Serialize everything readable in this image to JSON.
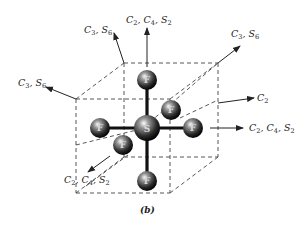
{
  "figure": {
    "caption": "(b)",
    "molecule": "SF6",
    "central_atom": {
      "label": "S"
    },
    "ligand_atoms": [
      {
        "position": "top",
        "label": "F"
      },
      {
        "position": "bottom",
        "label": "F"
      },
      {
        "position": "left",
        "label": "F"
      },
      {
        "position": "right",
        "label": "F"
      },
      {
        "position": "back",
        "label": "F"
      },
      {
        "position": "front",
        "label": "F"
      }
    ],
    "axis_labels": {
      "top": {
        "parts": [
          "C",
          "2",
          ", C",
          "4",
          ", S",
          "2"
        ]
      },
      "upper_left": {
        "parts": [
          "C",
          "3",
          ", S",
          "6"
        ]
      },
      "left": {
        "parts": [
          "C",
          "3",
          ", S",
          "6"
        ]
      },
      "upper_right": {
        "parts": [
          "C",
          "3",
          ", S",
          "6"
        ]
      },
      "right_c2": {
        "parts": [
          "C",
          "2"
        ]
      },
      "right": {
        "parts": [
          "C",
          "2",
          ", C",
          "4",
          ", S",
          "2"
        ]
      },
      "lower_left": {
        "parts": [
          "C",
          "2",
          ", C",
          "4",
          ", S",
          "2"
        ]
      }
    }
  }
}
